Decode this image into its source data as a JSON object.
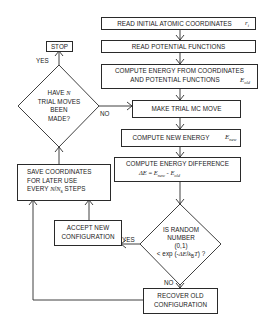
{
  "diagram": {
    "type": "flowchart",
    "nodes": {
      "read_coords": {
        "label": "READ INITIAL ATOMIC COORDINATES",
        "var": "r",
        "var_sub": "i"
      },
      "read_potentials": {
        "label": "READ POTENTIAL FUNCTIONS"
      },
      "compute_energy": {
        "line1": "COMPUTE ENERGY FROM COORDINATES",
        "line2": "AND POTENTIAL FUNCTIONS",
        "var": "E",
        "var_sub": "old"
      },
      "trial_move": {
        "label": "MAKE TRIAL MC MOVE"
      },
      "compute_new": {
        "label": "COMPUTE NEW ENERGY",
        "var": "E",
        "var_sub": "new"
      },
      "energy_diff": {
        "line1": "COMPUTE ENERGY DIFFERENCE",
        "eq_lhs": "ΔE",
        "eq_eq": " = ",
        "eq_e1": "E",
        "eq_e1_sub": "new",
        "eq_minus": " - ",
        "eq_e2": "E",
        "eq_e2_sub": "old"
      },
      "random_test": {
        "line1": "IS RANDOM",
        "line2": "NUMBER",
        "line3": "(0,1)",
        "line4_pre": "< exp (-",
        "line4_de": "ΔE",
        "line4_slash": "/",
        "line4_k": "k",
        "line4_ksub": "B",
        "line4_t": "T",
        "line4_post": ") ?"
      },
      "accept": {
        "line1": "ACCEPT NEW",
        "line2": "CONFIGURATION"
      },
      "recover": {
        "line1": "RECOVER OLD",
        "line2": "CONFIGURATION"
      },
      "save": {
        "line1": "SAVE COORDINATES",
        "line2": "FOR LATER USE",
        "line3_pre": "EVERY ",
        "line3_n": "N",
        "line3_slash": "/",
        "line3_ns": "N",
        "line3_ns_sub": "s",
        "line3_post": " STEPS"
      },
      "n_moves": {
        "line1_pre": "HAVE ",
        "line1_n": "N",
        "line2": "TRIAL MOVES",
        "line3": "BEEN",
        "line4": "MADE?"
      },
      "stop": {
        "label": "STOP"
      }
    },
    "edge_labels": {
      "n_moves_yes": "YES",
      "n_moves_no": "NO",
      "random_yes": "YES",
      "random_no": "NO"
    },
    "edges": [
      [
        "read_coords",
        "read_potentials"
      ],
      [
        "read_potentials",
        "compute_energy"
      ],
      [
        "compute_energy",
        "trial_move"
      ],
      [
        "trial_move",
        "compute_new"
      ],
      [
        "compute_new",
        "energy_diff"
      ],
      [
        "energy_diff",
        "random_test"
      ],
      [
        "random_test",
        "accept",
        "YES"
      ],
      [
        "random_test",
        "recover",
        "NO"
      ],
      [
        "accept",
        "save"
      ],
      [
        "recover",
        "save"
      ],
      [
        "save",
        "n_moves"
      ],
      [
        "n_moves",
        "trial_move",
        "NO"
      ],
      [
        "n_moves",
        "stop",
        "YES"
      ]
    ],
    "colors": {
      "line": "#2a2a2a",
      "text": "#1a1a1a",
      "background": "#ffffff"
    }
  }
}
